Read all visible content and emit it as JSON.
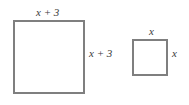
{
  "figure": {
    "large_square": {
      "top_label": "x + 3",
      "side_label": "x + 3"
    },
    "small_square": {
      "top_label": "x",
      "side_label": "x"
    },
    "colors": {
      "stroke": "#7f7f7f",
      "text": "#3a3a3a",
      "background": "#ffffff"
    }
  }
}
